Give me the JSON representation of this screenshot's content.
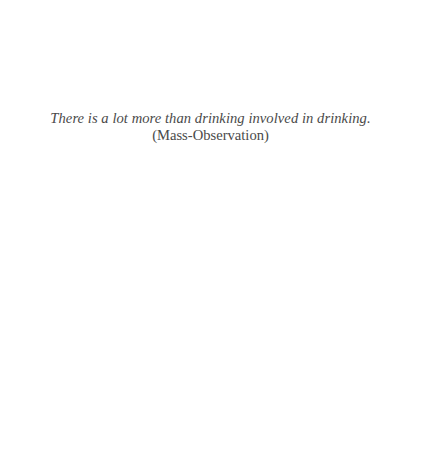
{
  "epigraph": {
    "quote": "There is a lot more than drinking involved in drinking.",
    "attribution": "(Mass-Observation)"
  },
  "colors": {
    "background": "#ffffff",
    "text": "#4a4a4a"
  }
}
